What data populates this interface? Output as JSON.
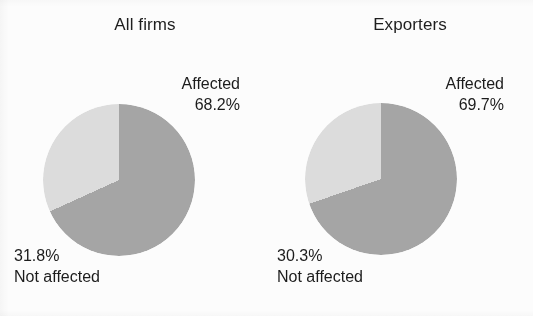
{
  "figure": {
    "background_color": "#fcfcfc",
    "panels": [
      {
        "id": "all-firms",
        "title": "All firms",
        "affected_label": "Affected",
        "affected_value": "68.2%",
        "not_affected_value": "31.8%",
        "not_affected_label": "Not affected"
      },
      {
        "id": "exporters",
        "title": "Exporters",
        "affected_label": "Affected",
        "affected_value": "69.7%",
        "not_affected_value": "30.3%",
        "not_affected_label": "Not affected"
      }
    ]
  },
  "colors": {
    "affected_slice": "#a9a9a9",
    "not_affected_slice": "#e2e2e2",
    "text": "#1c1c1c"
  },
  "chart_data": [
    {
      "type": "pie",
      "title": "All firms",
      "labels": [
        "Affected",
        "Not affected"
      ],
      "values": [
        68.2,
        31.8
      ],
      "value_labels": [
        "68.2%",
        "31.8%"
      ],
      "colors": [
        "#a9a9a9",
        "#e2e2e2"
      ],
      "start_angle_deg": 0,
      "direction": "clockwise",
      "legend": "none",
      "grid": false
    },
    {
      "type": "pie",
      "title": "Exporters",
      "labels": [
        "Affected",
        "Not affected"
      ],
      "values": [
        69.7,
        30.3
      ],
      "value_labels": [
        "69.7%",
        "30.3%"
      ],
      "colors": [
        "#a9a9a9",
        "#e2e2e2"
      ],
      "start_angle_deg": 0,
      "direction": "clockwise",
      "legend": "none",
      "grid": false
    }
  ]
}
